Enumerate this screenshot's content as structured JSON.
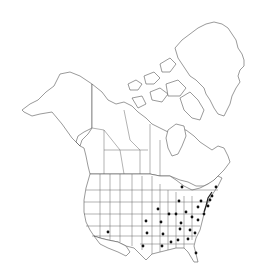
{
  "map": {
    "type": "species-distribution-map",
    "region": "North America",
    "background_color": "#ffffff",
    "outline_color": "#555555",
    "dot_color": "#111111",
    "occurrences": [
      {
        "region": "Arizona"
      },
      {
        "region": "Texas"
      },
      {
        "region": "Oklahoma"
      },
      {
        "region": "Kansas"
      },
      {
        "region": "Missouri"
      },
      {
        "region": "Arkansas"
      },
      {
        "region": "Louisiana"
      },
      {
        "region": "Mississippi"
      },
      {
        "region": "Alabama"
      },
      {
        "region": "Georgia"
      },
      {
        "region": "Florida"
      },
      {
        "region": "South Carolina"
      },
      {
        "region": "North Carolina"
      },
      {
        "region": "Tennessee"
      },
      {
        "region": "Kentucky"
      },
      {
        "region": "Virginia"
      },
      {
        "region": "West Virginia"
      },
      {
        "region": "Iowa"
      },
      {
        "region": "Illinois"
      },
      {
        "region": "Indiana"
      },
      {
        "region": "Ohio"
      },
      {
        "region": "Pennsylvania"
      },
      {
        "region": "New York"
      },
      {
        "region": "Michigan"
      },
      {
        "region": "Ontario"
      },
      {
        "region": "Maine"
      },
      {
        "region": "Maryland"
      },
      {
        "region": "New Jersey"
      },
      {
        "region": "Massachusetts"
      },
      {
        "region": "Connecticut"
      }
    ]
  }
}
